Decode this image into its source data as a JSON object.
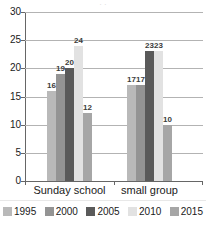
{
  "chart_data": {
    "type": "bar",
    "title": "",
    "xlabel": "",
    "ylabel": "",
    "categories": [
      "Sunday school",
      "small group"
    ],
    "series": [
      {
        "name": "1995",
        "color": "#b9b9b9",
        "values": [
          16,
          17
        ]
      },
      {
        "name": "2000",
        "color": "#949494",
        "values": [
          19,
          17
        ]
      },
      {
        "name": "2005",
        "color": "#5a5a5a",
        "values": [
          20,
          23
        ]
      },
      {
        "name": "2010",
        "color": "#e2e2e2",
        "values": [
          24,
          23
        ]
      },
      {
        "name": "2015",
        "color": "#a6a6a6",
        "values": [
          12,
          10
        ]
      }
    ],
    "ylim": [
      0,
      30
    ],
    "yticks": [
      0,
      5,
      10,
      15,
      20,
      25,
      30
    ],
    "ytick_labels": [
      "0",
      "5",
      "10",
      "15",
      "20",
      "25",
      "30"
    ],
    "grid": true,
    "legend_position": "bottom",
    "data_labels": true
  },
  "axis": {
    "line_color": "#666666",
    "grid_color": "#b3b3b3"
  },
  "title_remnant": "· ·"
}
